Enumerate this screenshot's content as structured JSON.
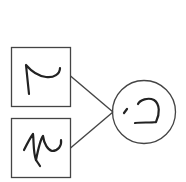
{
  "diagram": {
    "type": "handwritten-digit-graph",
    "stroke_color": "#333333",
    "background": "#ffffff",
    "inputs": [
      {
        "id": "input-1",
        "shape": "square",
        "glyph": "handwritten digit (rotated, resembles 7/2)"
      },
      {
        "id": "input-2",
        "shape": "square",
        "glyph": "handwritten digit (rotated, resembles 2/N)"
      }
    ],
    "output": {
      "id": "output",
      "shape": "circle",
      "glyph": "handwritten digit (rotated, resembles 5)"
    },
    "edges": [
      {
        "from": "input-1",
        "to": "output"
      },
      {
        "from": "input-2",
        "to": "output"
      }
    ]
  }
}
